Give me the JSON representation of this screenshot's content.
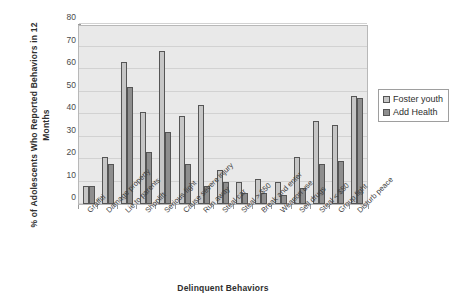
{
  "chart_data": {
    "type": "bar",
    "title": "",
    "xlabel": "Delinquent Behaviors",
    "ylabel": "% of  Adolescents Who Reported Behaviors in 12 Months",
    "ylabel_lines": [
      "% of  Adolescents Who Reported Behaviors in 12",
      "Months"
    ],
    "ylim": [
      0,
      80
    ],
    "yticks": [
      0,
      10,
      20,
      30,
      40,
      50,
      60,
      70,
      80
    ],
    "ytick_labels": [
      "0",
      "10",
      "20",
      "30",
      "40",
      "50",
      "60",
      "70",
      "80"
    ],
    "grid": true,
    "legend_position": "right",
    "categories": [
      "Graffiti",
      "Damage property",
      "Lie to parents",
      "Shoplift",
      "Serious fight",
      "Cause severe injury",
      "Run away",
      "Steal car",
      "Steal > $50",
      "Break and enter",
      "Weapon use",
      "Sell drugs",
      "Steal < $50",
      "Group fight",
      "Disturb peace"
    ],
    "series": [
      {
        "name": "Foster youth",
        "color": "#c6c6c6",
        "values": [
          8,
          21,
          63,
          41,
          68,
          39,
          44,
          15,
          10,
          11,
          10,
          21,
          37,
          35,
          48
        ]
      },
      {
        "name": "Add Health",
        "color": "#8e8e8e",
        "values": [
          8,
          18,
          52,
          23,
          32,
          18,
          8,
          10,
          5,
          5,
          4,
          7,
          18,
          19,
          47
        ]
      }
    ]
  },
  "legend": {
    "items": [
      {
        "label": "Foster youth",
        "series_class": "series-foster"
      },
      {
        "label": "Add Health",
        "series_class": "series-add"
      }
    ]
  }
}
